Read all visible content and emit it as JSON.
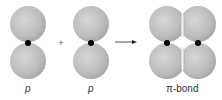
{
  "diagram": {
    "labels": {
      "left": "p",
      "middle": "p",
      "right": "π-bond"
    },
    "operator": "+",
    "colors": {
      "lobe": "#b9b9b9",
      "lobe_edge": "#9a9a9a",
      "nucleus": "#000000",
      "overlap_highlight": "#f2f2f2",
      "text": "#333333"
    }
  }
}
